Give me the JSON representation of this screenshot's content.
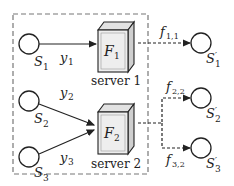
{
  "diagram": {
    "sources": [
      {
        "id": "S1",
        "label": "S",
        "sub": "1"
      },
      {
        "id": "S2",
        "label": "S",
        "sub": "2"
      },
      {
        "id": "S3",
        "label": "S",
        "sub": "3"
      }
    ],
    "servers": [
      {
        "id": "server1",
        "func_label": "F",
        "func_sub": "1",
        "name": "server 1"
      },
      {
        "id": "server2",
        "func_label": "F",
        "func_sub": "2",
        "name": "server 2"
      }
    ],
    "destinations": [
      {
        "id": "S1p",
        "label": "S",
        "sub": "1",
        "prime": "′"
      },
      {
        "id": "S2p",
        "label": "S",
        "sub": "2",
        "prime": "′"
      },
      {
        "id": "S3p",
        "label": "S",
        "sub": "3",
        "prime": "′"
      }
    ],
    "input_edges": [
      {
        "from": "S1",
        "to": "server1",
        "label": "y",
        "sub": "1"
      },
      {
        "from": "S2",
        "to": "server2",
        "label": "y",
        "sub": "2"
      },
      {
        "from": "S3",
        "to": "server2",
        "label": "y",
        "sub": "3"
      }
    ],
    "output_edges": [
      {
        "from": "server1",
        "to": "S1p",
        "label": "f",
        "sub": "1,1"
      },
      {
        "from": "server2",
        "to": "S2p",
        "label": "f",
        "sub": "2,2"
      },
      {
        "from": "server2",
        "to": "S3p",
        "label": "f",
        "sub": "3,2"
      }
    ],
    "colors": {
      "stroke": "#222222",
      "dashed_box": "#777777",
      "box_front": "#eeeeee",
      "box_side": "#cfcfcf",
      "box_top": "#e2e2e2"
    }
  }
}
